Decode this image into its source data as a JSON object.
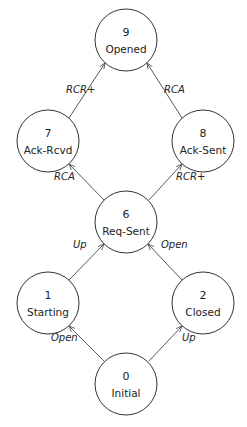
{
  "diagram": {
    "type": "state-transition-graph",
    "nodes": [
      {
        "id": "9",
        "number": "9",
        "label": "Opened",
        "cx": 126,
        "cy": 40
      },
      {
        "id": "7",
        "number": "7",
        "label": "Ack-Rcvd",
        "cx": 48,
        "cy": 141
      },
      {
        "id": "8",
        "number": "8",
        "label": "Ack-Sent",
        "cx": 203,
        "cy": 141
      },
      {
        "id": "6",
        "number": "6",
        "label": "Req-Sent",
        "cx": 126,
        "cy": 222
      },
      {
        "id": "1",
        "number": "1",
        "label": "Starting",
        "cx": 48,
        "cy": 303
      },
      {
        "id": "2",
        "number": "2",
        "label": "Closed",
        "cx": 203,
        "cy": 303
      },
      {
        "id": "0",
        "number": "0",
        "label": "Initial",
        "cx": 126,
        "cy": 384
      }
    ],
    "edges": [
      {
        "from": "7",
        "to": "9",
        "label": "RCR+"
      },
      {
        "from": "8",
        "to": "9",
        "label": "RCA"
      },
      {
        "from": "6",
        "to": "7",
        "label": "RCA"
      },
      {
        "from": "6",
        "to": "8",
        "label": "RCR+"
      },
      {
        "from": "1",
        "to": "6",
        "label": "Up"
      },
      {
        "from": "2",
        "to": "6",
        "label": "Open"
      },
      {
        "from": "0",
        "to": "1",
        "label": "Open"
      },
      {
        "from": "0",
        "to": "2",
        "label": "Up"
      }
    ]
  }
}
